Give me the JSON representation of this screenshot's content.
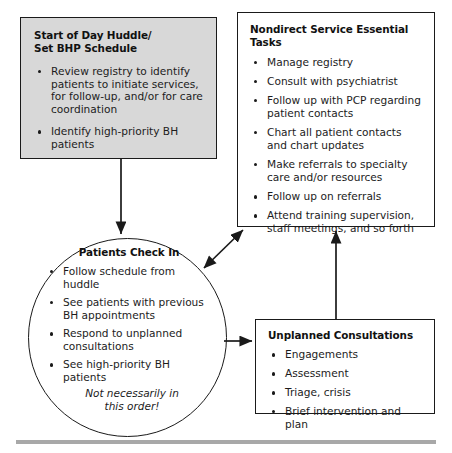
{
  "diagram": {
    "nodes": {
      "huddle": {
        "title_line1": "Start of Day Huddle/",
        "title_line2": "Set BHP Schedule",
        "shape": "rectangle-shaded",
        "fill_color": "#d8d8d8",
        "border_color": "#1a1a1a",
        "bullets": [
          "Review registry to identify patients to initiate services, for follow-up, and/or for care coordination",
          "Identify high-priority BH patients"
        ]
      },
      "nondirect": {
        "title_line1": "Nondirect Service Essential Tasks",
        "shape": "rectangle",
        "fill_color": "#ffffff",
        "border_color": "#1a1a1a",
        "bullets": [
          "Manage registry",
          "Consult with psychiatrist",
          "Follow up with PCP regarding patient contacts",
          "Chart all patient contacts and chart updates",
          "Make referrals to specialty care and/or resources",
          "Follow up on referrals",
          "Attend training supervision, staff meetings, and so forth"
        ]
      },
      "checkin": {
        "title_line1": "Patients Check In",
        "shape": "circle",
        "fill_color": "#ffffff",
        "border_color": "#1a1a1a",
        "bullets": [
          "Follow schedule from huddle",
          "See patients with previous BH appointments",
          "Respond to unplanned consultations",
          "See high-priority BH patients"
        ],
        "note_line1": "Not necessarily in",
        "note_line2": "this order!"
      },
      "unplanned": {
        "title_line1": "Unplanned Consultations",
        "shape": "rectangle",
        "fill_color": "#ffffff",
        "border_color": "#1a1a1a",
        "bullets": [
          "Engagements",
          "Assessment",
          "Triage, crisis",
          "Brief intervention and plan"
        ]
      }
    },
    "connectors": [
      {
        "name": "huddle-to-checkin",
        "from": "huddle",
        "to": "checkin",
        "arrowheads": "end",
        "direction": "down"
      },
      {
        "name": "checkin-to-nondirect",
        "from": "checkin",
        "to": "nondirect",
        "arrowheads": "both",
        "direction": "diagonal-up-right"
      },
      {
        "name": "checkin-to-unplanned",
        "from": "checkin",
        "to": "unplanned",
        "arrowheads": "end",
        "direction": "right"
      },
      {
        "name": "unplanned-to-nondirect",
        "from": "unplanned",
        "to": "nondirect",
        "arrowheads": "end",
        "direction": "up"
      }
    ],
    "rule_color": "#a8a8a8"
  }
}
